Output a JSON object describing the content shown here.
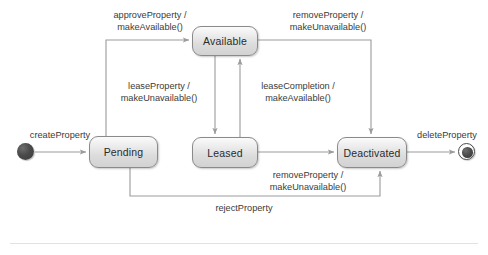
{
  "diagram": {
    "type": "uml-state-machine",
    "states": [
      {
        "id": "pending",
        "label": "Pending",
        "x": 89,
        "y": 136,
        "w": 69,
        "h": 32
      },
      {
        "id": "available",
        "label": "Available",
        "x": 192,
        "y": 26,
        "w": 66,
        "h": 30
      },
      {
        "id": "leased",
        "label": "Leased",
        "x": 192,
        "y": 137,
        "w": 66,
        "h": 31
      },
      {
        "id": "deactivated",
        "label": "Deactivated",
        "x": 337,
        "y": 137,
        "w": 70,
        "h": 31
      }
    ],
    "pseudostates": [
      {
        "id": "initial",
        "kind": "initial",
        "cx": 26,
        "cy": 152
      },
      {
        "id": "final",
        "kind": "final",
        "cx": 467,
        "cy": 152
      }
    ],
    "transitions": [
      {
        "id": "t-create",
        "from": "initial",
        "to": "pending",
        "label": "createProperty"
      },
      {
        "id": "t-approve",
        "from": "pending",
        "to": "available",
        "label": "approveProperty /\nmakeAvailable()"
      },
      {
        "id": "t-lease",
        "from": "available",
        "to": "leased",
        "label": "leaseProperty /\nmakeUnavailable()"
      },
      {
        "id": "t-complete",
        "from": "leased",
        "to": "available",
        "label": "leaseCompletion /\nmakeAvailable()"
      },
      {
        "id": "t-remove-a",
        "from": "available",
        "to": "deactivated",
        "label": "removeProperty /\nmakeUnavailable()"
      },
      {
        "id": "t-remove-l",
        "from": "leased",
        "to": "deactivated",
        "label": "removeProperty /\nmakeUnavailable()"
      },
      {
        "id": "t-reject",
        "from": "pending",
        "to": "deactivated",
        "label": "rejectProperty"
      },
      {
        "id": "t-delete",
        "from": "deactivated",
        "to": "final",
        "label": "deleteProperty"
      }
    ],
    "labels": {
      "create_property": "createProperty",
      "approve_property_line1": "approveProperty /",
      "approve_property_line2": "makeAvailable()",
      "remove_property_top_line1": "removeProperty /",
      "remove_property_top_line2": "makeUnavailable()",
      "lease_property_line1": "leaseProperty /",
      "lease_property_line2": "makeUnavailable()",
      "lease_completion_line1": "leaseCompletion /",
      "lease_completion_line2": "makeAvailable()",
      "remove_property_mid_line1": "removeProperty /",
      "remove_property_mid_line2": "makeUnavailable()",
      "reject_property": "rejectProperty",
      "delete_property": "deleteProperty"
    },
    "colors": {
      "background": "#ffffff",
      "state_border": "#8a8a8a",
      "state_fill_top": "#fbfbfb",
      "state_fill_bottom": "#d2d2d2",
      "edge_stroke": "#9b9b9b",
      "text": "#2b2b2b",
      "label_text": "#3a3a3a",
      "node_fill": "#4a4a4a"
    }
  }
}
